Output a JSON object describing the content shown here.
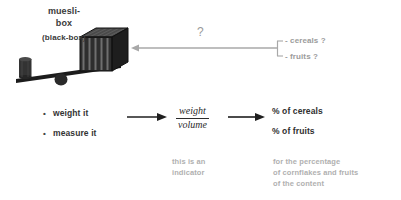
{
  "slide": {
    "background_color": "#ffffff",
    "width": 401,
    "height": 200
  },
  "diagram": {
    "box_title_line1": "muesli-",
    "box_title_line2": "box",
    "box_subtitle": "(black-box)",
    "question_mark": "?",
    "unknown_items": [
      "- cereals ?",
      "- fruits ?"
    ],
    "actions": [
      {
        "bullet": "•",
        "label": "weight it"
      },
      {
        "bullet": "•",
        "label": "measure it"
      }
    ],
    "formula": {
      "numerator": "weight",
      "denominator": "volume"
    },
    "results": [
      "% of cereals",
      "% of fruits"
    ],
    "notes": {
      "indicator_note_line1": "this is an",
      "indicator_note_line2": "indicator",
      "percentage_note_line1": "for the percentage",
      "percentage_note_line2": "of cornflakes and fruits",
      "percentage_note_line3": "of the content"
    },
    "colors": {
      "text_dark": "#333333",
      "text_gray": "#9b9b9b",
      "note_gray": "#b0b0b0",
      "box_dark": "#2b2b2b",
      "arrow_dark": "#1f1f1f",
      "arrow_gray": "#a8a8a8"
    },
    "icons": {
      "muesli_box": "black-box-cube-icon",
      "balance": "balance-scale-icon",
      "weight": "cylinder-weight-icon",
      "query_arrow": "left-arrow-icon",
      "process_arrow_1": "right-arrow-icon",
      "process_arrow_2": "right-arrow-icon"
    }
  }
}
